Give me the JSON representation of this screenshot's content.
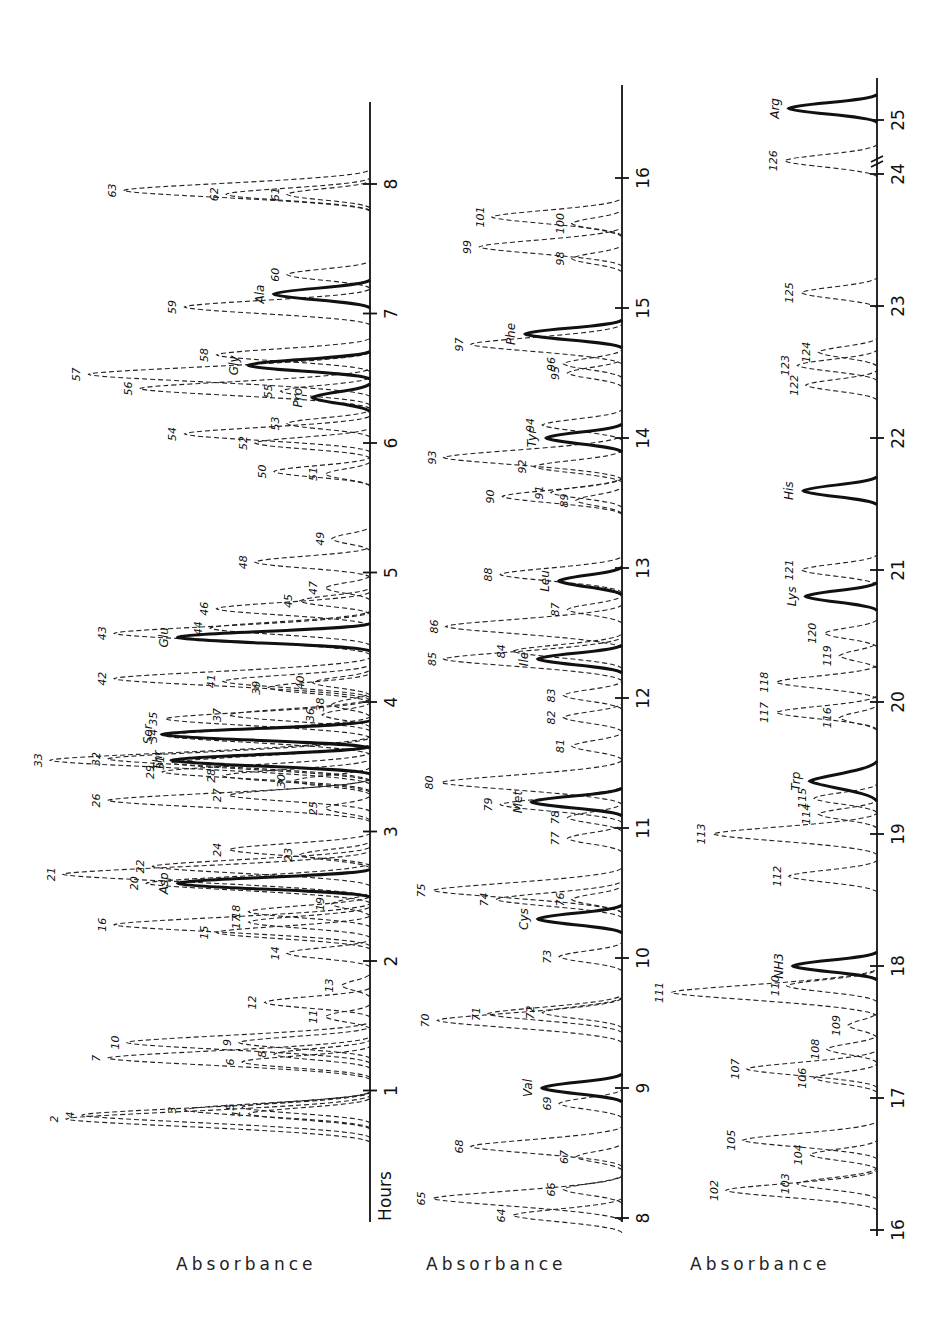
{
  "chart_data": [
    {
      "type": "line",
      "title": "",
      "panel": 1,
      "orientation": "rotated 90deg, time axis vertical (bottom to top)",
      "xlabel": "Hours",
      "ylabel": "Absorbance",
      "xlim": [
        0,
        8.3
      ],
      "ticks": [
        1,
        2,
        3,
        4,
        5,
        6,
        7,
        8
      ],
      "solid_peaks": [
        {
          "name": "Asp",
          "x": 2.6,
          "height": 0.6
        },
        {
          "name": "Thr",
          "x": 3.55,
          "height": 0.62
        },
        {
          "name": "Ser",
          "x": 3.75,
          "height": 0.65
        },
        {
          "name": "Glu",
          "x": 4.5,
          "height": 0.6
        },
        {
          "name": "Pro",
          "x": 6.35,
          "height": 0.18
        },
        {
          "name": "Gly",
          "x": 6.6,
          "height": 0.38
        },
        {
          "name": "Ala",
          "x": 7.15,
          "height": 0.3
        }
      ],
      "dashed_peaks": [
        {
          "id": 1,
          "x": 0.82,
          "height": 0.38
        },
        {
          "id": 2,
          "x": 0.78,
          "height": 0.95
        },
        {
          "id": 3,
          "x": 0.85,
          "height": 0.58
        },
        {
          "id": 4,
          "x": 0.81,
          "height": 0.9
        },
        {
          "id": 5,
          "x": 0.87,
          "height": 0.4
        },
        {
          "id": 6,
          "x": 1.22,
          "height": 0.4
        },
        {
          "id": 7,
          "x": 1.25,
          "height": 0.82
        },
        {
          "id": 8,
          "x": 1.28,
          "height": 0.3
        },
        {
          "id": 9,
          "x": 1.37,
          "height": 0.41
        },
        {
          "id": 10,
          "x": 1.37,
          "height": 0.76
        },
        {
          "id": 11,
          "x": 1.57,
          "height": 0.14
        },
        {
          "id": 12,
          "x": 1.68,
          "height": 0.33
        },
        {
          "id": 13,
          "x": 1.81,
          "height": 0.09
        },
        {
          "id": 14,
          "x": 2.06,
          "height": 0.26
        },
        {
          "id": 15,
          "x": 2.22,
          "height": 0.48
        },
        {
          "id": 16,
          "x": 2.28,
          "height": 0.8
        },
        {
          "id": 17,
          "x": 2.3,
          "height": 0.38
        },
        {
          "id": 18,
          "x": 2.38,
          "height": 0.38
        },
        {
          "id": 19,
          "x": 2.44,
          "height": 0.12
        },
        {
          "id": 20,
          "x": 2.6,
          "height": 0.7
        },
        {
          "id": 21,
          "x": 2.67,
          "height": 0.96
        },
        {
          "id": 22,
          "x": 2.73,
          "height": 0.68
        },
        {
          "id": 23,
          "x": 2.82,
          "height": 0.22
        },
        {
          "id": 24,
          "x": 2.86,
          "height": 0.44
        },
        {
          "id": 25,
          "x": 3.18,
          "height": 0.14
        },
        {
          "id": 26,
          "x": 3.24,
          "height": 0.82
        },
        {
          "id": 27,
          "x": 3.28,
          "height": 0.44
        },
        {
          "id": 28,
          "x": 3.43,
          "height": 0.46
        },
        {
          "id": 29,
          "x": 3.46,
          "height": 0.65
        },
        {
          "id": 30,
          "x": 3.39,
          "height": 0.24
        },
        {
          "id": 31,
          "x": 3.53,
          "height": 0.62
        },
        {
          "id": 32,
          "x": 3.56,
          "height": 0.82
        },
        {
          "id": 33,
          "x": 3.55,
          "height": 1.0
        },
        {
          "id": 34,
          "x": 3.74,
          "height": 0.64
        },
        {
          "id": 35,
          "x": 3.87,
          "height": 0.64
        },
        {
          "id": 36,
          "x": 3.9,
          "height": 0.15
        },
        {
          "id": 37,
          "x": 3.9,
          "height": 0.44
        },
        {
          "id": 38,
          "x": 3.98,
          "height": 0.12
        },
        {
          "id": 39,
          "x": 4.11,
          "height": 0.32
        },
        {
          "id": 40,
          "x": 4.15,
          "height": 0.18
        },
        {
          "id": 41,
          "x": 4.16,
          "height": 0.46
        },
        {
          "id": 42,
          "x": 4.18,
          "height": 0.8
        },
        {
          "id": 43,
          "x": 4.53,
          "height": 0.8
        },
        {
          "id": 44,
          "x": 4.57,
          "height": 0.5
        },
        {
          "id": 45,
          "x": 4.78,
          "height": 0.22
        },
        {
          "id": 46,
          "x": 4.72,
          "height": 0.48
        },
        {
          "id": 47,
          "x": 4.88,
          "height": 0.14
        },
        {
          "id": 48,
          "x": 5.08,
          "height": 0.36
        },
        {
          "id": 49,
          "x": 5.26,
          "height": 0.12
        },
        {
          "id": 50,
          "x": 5.78,
          "height": 0.3
        },
        {
          "id": 51,
          "x": 5.76,
          "height": 0.14
        },
        {
          "id": 52,
          "x": 6.0,
          "height": 0.36
        },
        {
          "id": 53,
          "x": 6.15,
          "height": 0.26
        },
        {
          "id": 54,
          "x": 6.07,
          "height": 0.58
        },
        {
          "id": 55,
          "x": 6.4,
          "height": 0.28
        },
        {
          "id": 56,
          "x": 6.42,
          "height": 0.72
        },
        {
          "id": 57,
          "x": 6.53,
          "height": 0.88
        },
        {
          "id": 58,
          "x": 6.68,
          "height": 0.48
        },
        {
          "id": 59,
          "x": 7.05,
          "height": 0.58
        },
        {
          "id": 60,
          "x": 7.3,
          "height": 0.26
        },
        {
          "id": 61,
          "x": 7.92,
          "height": 0.26
        },
        {
          "id": 62,
          "x": 7.92,
          "height": 0.45
        },
        {
          "id": 63,
          "x": 7.95,
          "height": 0.77
        }
      ]
    },
    {
      "type": "line",
      "panel": 2,
      "orientation": "rotated 90deg, time axis vertical (bottom to top)",
      "xlabel": "",
      "ylabel": "Absorbance",
      "xlim": [
        8,
        16.7
      ],
      "ticks": [
        8,
        9,
        10,
        11,
        12,
        13,
        14,
        15,
        16
      ],
      "solid_peaks": [
        {
          "name": "Val",
          "x": 9.0,
          "height": 0.38
        },
        {
          "name": "Cys",
          "x": 10.3,
          "height": 0.4
        },
        {
          "name": "Met",
          "x": 11.2,
          "height": 0.43
        },
        {
          "name": "Ile",
          "x": 12.3,
          "height": 0.4
        },
        {
          "name": "Leu",
          "x": 12.9,
          "height": 0.3
        },
        {
          "name": "Tyr",
          "x": 14.0,
          "height": 0.36
        },
        {
          "name": "Phe",
          "x": 14.8,
          "height": 0.46
        }
      ],
      "dashed_peaks": [
        {
          "id": 64,
          "x": 8.02,
          "height": 0.52
        },
        {
          "id": 65,
          "x": 8.15,
          "height": 0.9
        },
        {
          "id": 66,
          "x": 8.22,
          "height": 0.28
        },
        {
          "id": 67,
          "x": 8.47,
          "height": 0.22
        },
        {
          "id": 68,
          "x": 8.55,
          "height": 0.72
        },
        {
          "id": 69,
          "x": 8.88,
          "height": 0.3
        },
        {
          "id": 70,
          "x": 9.52,
          "height": 0.88
        },
        {
          "id": 71,
          "x": 9.57,
          "height": 0.64
        },
        {
          "id": 72,
          "x": 9.58,
          "height": 0.38
        },
        {
          "id": 73,
          "x": 10.01,
          "height": 0.3
        },
        {
          "id": 74,
          "x": 10.45,
          "height": 0.6
        },
        {
          "id": 75,
          "x": 10.52,
          "height": 0.9
        },
        {
          "id": 76,
          "x": 10.45,
          "height": 0.24
        },
        {
          "id": 77,
          "x": 10.92,
          "height": 0.26
        },
        {
          "id": 78,
          "x": 11.08,
          "height": 0.26
        },
        {
          "id": 79,
          "x": 11.18,
          "height": 0.58
        },
        {
          "id": 80,
          "x": 11.35,
          "height": 0.86
        },
        {
          "id": 81,
          "x": 11.63,
          "height": 0.24
        },
        {
          "id": 82,
          "x": 11.85,
          "height": 0.28
        },
        {
          "id": 83,
          "x": 12.02,
          "height": 0.28
        },
        {
          "id": 84,
          "x": 12.36,
          "height": 0.52
        },
        {
          "id": 85,
          "x": 12.3,
          "height": 0.85
        },
        {
          "id": 86,
          "x": 12.55,
          "height": 0.84
        },
        {
          "id": 87,
          "x": 12.68,
          "height": 0.26
        },
        {
          "id": 88,
          "x": 12.95,
          "height": 0.58
        },
        {
          "id": 89,
          "x": 13.52,
          "height": 0.22
        },
        {
          "id": 90,
          "x": 13.55,
          "height": 0.57
        },
        {
          "id": 91,
          "x": 13.58,
          "height": 0.34
        },
        {
          "id": 92,
          "x": 13.78,
          "height": 0.42
        },
        {
          "id": 93,
          "x": 13.85,
          "height": 0.85
        },
        {
          "id": 94,
          "x": 14.1,
          "height": 0.38
        },
        {
          "id": 95,
          "x": 14.5,
          "height": 0.26
        },
        {
          "id": 96,
          "x": 14.57,
          "height": 0.28
        },
        {
          "id": 97,
          "x": 14.72,
          "height": 0.72
        },
        {
          "id": 98,
          "x": 15.38,
          "height": 0.24
        },
        {
          "id": 99,
          "x": 15.47,
          "height": 0.68
        },
        {
          "id": 100,
          "x": 15.65,
          "height": 0.24
        },
        {
          "id": 101,
          "x": 15.7,
          "height": 0.62
        }
      ]
    },
    {
      "type": "line",
      "panel": 3,
      "orientation": "rotated 90deg, time axis vertical (bottom to top)",
      "xlabel": "",
      "ylabel": "Absorbance",
      "xlim": [
        16,
        25.5
      ],
      "ticks": [
        16,
        17,
        18,
        19,
        20,
        21,
        22,
        23,
        24,
        25
      ],
      "axis_break": "between 24 and 25",
      "solid_peaks": [
        {
          "name": "NH3",
          "x": 18.0,
          "height": 0.4
        },
        {
          "name": "Trp",
          "x": 19.4,
          "height": 0.32
        },
        {
          "name": "Lys",
          "x": 20.8,
          "height": 0.34
        },
        {
          "name": "His",
          "x": 21.6,
          "height": 0.35
        },
        {
          "name": "Arg",
          "x": 25.2,
          "height": 0.42
        }
      ],
      "dashed_peaks": [
        {
          "id": 102,
          "x": 16.3,
          "height": 0.72
        },
        {
          "id": 103,
          "x": 16.35,
          "height": 0.38
        },
        {
          "id": 104,
          "x": 16.57,
          "height": 0.32
        },
        {
          "id": 105,
          "x": 16.68,
          "height": 0.64
        },
        {
          "id": 106,
          "x": 17.15,
          "height": 0.3
        },
        {
          "id": 107,
          "x": 17.22,
          "height": 0.62
        },
        {
          "id": 108,
          "x": 17.37,
          "height": 0.24
        },
        {
          "id": 109,
          "x": 17.55,
          "height": 0.14
        },
        {
          "id": 110,
          "x": 17.85,
          "height": 0.43
        },
        {
          "id": 111,
          "x": 17.8,
          "height": 0.98
        },
        {
          "id": 112,
          "x": 18.68,
          "height": 0.42
        },
        {
          "id": 113,
          "x": 19.0,
          "height": 0.78
        },
        {
          "id": 114,
          "x": 19.15,
          "height": 0.28
        },
        {
          "id": 115,
          "x": 19.27,
          "height": 0.3
        },
        {
          "id": 116,
          "x": 19.88,
          "height": 0.18
        },
        {
          "id": 117,
          "x": 19.92,
          "height": 0.48
        },
        {
          "id": 118,
          "x": 20.15,
          "height": 0.48
        },
        {
          "id": 119,
          "x": 20.35,
          "height": 0.18
        },
        {
          "id": 120,
          "x": 20.52,
          "height": 0.25
        },
        {
          "id": 121,
          "x": 21.0,
          "height": 0.36
        },
        {
          "id": 122,
          "x": 22.4,
          "height": 0.34
        },
        {
          "id": 123,
          "x": 22.55,
          "height": 0.38
        },
        {
          "id": 124,
          "x": 22.65,
          "height": 0.28
        },
        {
          "id": 125,
          "x": 23.1,
          "height": 0.36
        },
        {
          "id": 126,
          "x": 24.1,
          "height": 0.44
        }
      ]
    }
  ],
  "labels": {
    "hours": "Hours",
    "absorbance_1": "Absorbance",
    "absorbance_2": "Absorbance",
    "absorbance_3": "Absorbance"
  }
}
